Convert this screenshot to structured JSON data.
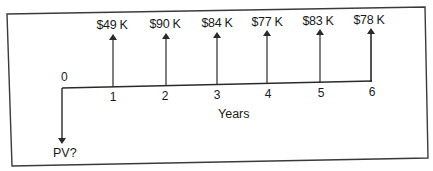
{
  "diagram": {
    "type": "cash-flow-timeline",
    "origin_label": "0",
    "axis_label": "Years",
    "present_value_label": "PV?",
    "periods": [
      {
        "label": "1",
        "amount": "$49 K"
      },
      {
        "label": "2",
        "amount": "$90 K"
      },
      {
        "label": "3",
        "amount": "$84 K"
      },
      {
        "label": "4",
        "amount": "$77 K"
      },
      {
        "label": "5",
        "amount": "$83 K"
      },
      {
        "label": "6",
        "amount": "$78 K"
      }
    ],
    "colors": {
      "line": "#2a2a2a",
      "frame": "#3a3a3a",
      "text": "#1a1a1a",
      "background": "#ffffff"
    }
  }
}
